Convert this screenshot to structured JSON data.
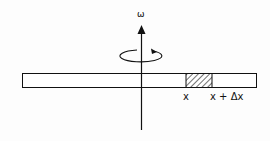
{
  "diagram": {
    "axis_label": "ω",
    "segment_start_label": "x",
    "segment_end_label": "x + Δx",
    "colors": {
      "stroke": "#111111",
      "background": "#fdfdfd"
    }
  }
}
